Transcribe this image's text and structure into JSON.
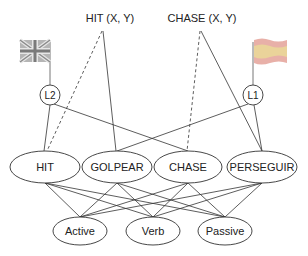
{
  "diagram": {
    "top_labels": {
      "hit_xy": "HIT (X, Y)",
      "chase_xy": "CHASE (X, Y)"
    },
    "language_nodes": {
      "l2": "L2",
      "l1": "L1"
    },
    "flags": {
      "l2": "uk-flag-icon",
      "l1": "spain-flag-icon"
    },
    "lemma_nodes": [
      "HIT",
      "GOLPEAR",
      "CHASE",
      "PERSEGUIR"
    ],
    "feature_nodes": [
      "Active",
      "Verb",
      "Passive"
    ],
    "colors": {
      "line": "#333333",
      "flag_gray_dark": "#8a8a8a",
      "flag_gray_light": "#c8c8c8",
      "spain_stripe_outer": "#e8b0a8",
      "spain_stripe_inner": "#ead39a"
    },
    "edges": {
      "solid": [
        [
          "HIT (X, Y)",
          "GOLPEAR"
        ],
        [
          "CHASE (X, Y)",
          "PERSEGUIR"
        ],
        [
          "L2",
          "HIT"
        ],
        [
          "L2",
          "CHASE"
        ],
        [
          "L1",
          "GOLPEAR"
        ],
        [
          "L1",
          "PERSEGUIR"
        ],
        [
          "each lemma",
          "each feature"
        ]
      ],
      "dashed": [
        [
          "HIT (X, Y)",
          "HIT"
        ],
        [
          "CHASE (X, Y)",
          "CHASE"
        ]
      ]
    }
  }
}
